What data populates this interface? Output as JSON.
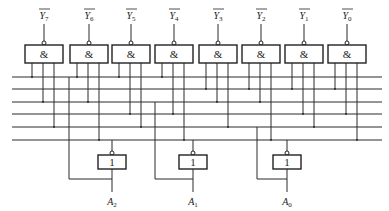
{
  "figure": {
    "title_fragment": "图 3-20 8 线-3 线编码器逻辑图",
    "and_gate_symbol": "&",
    "or_gate_symbol": "1",
    "inputs": [
      {
        "name": "Y",
        "sub": "7",
        "overbar": true,
        "gate_x": 25
      },
      {
        "name": "Y",
        "sub": "6",
        "overbar": true,
        "gate_x": 70
      },
      {
        "name": "Y",
        "sub": "5",
        "overbar": true,
        "gate_x": 112
      },
      {
        "name": "Y",
        "sub": "4",
        "overbar": true,
        "gate_x": 155
      },
      {
        "name": "Y",
        "sub": "3",
        "overbar": true,
        "gate_x": 199
      },
      {
        "name": "Y",
        "sub": "2",
        "overbar": true,
        "gate_x": 242
      },
      {
        "name": "Y",
        "sub": "1",
        "overbar": true,
        "gate_x": 285
      },
      {
        "name": "Y",
        "sub": "0",
        "overbar": true,
        "gate_x": 328
      }
    ],
    "outputs": [
      {
        "name": "A",
        "sub": "2",
        "gate_x": 98
      },
      {
        "name": "A",
        "sub": "1",
        "gate_x": 179
      },
      {
        "name": "A",
        "sub": "0",
        "gate_x": 273
      }
    ],
    "bus_lines_y": [
      77,
      89,
      102,
      114,
      127,
      140
    ],
    "bus_count": 6
  }
}
